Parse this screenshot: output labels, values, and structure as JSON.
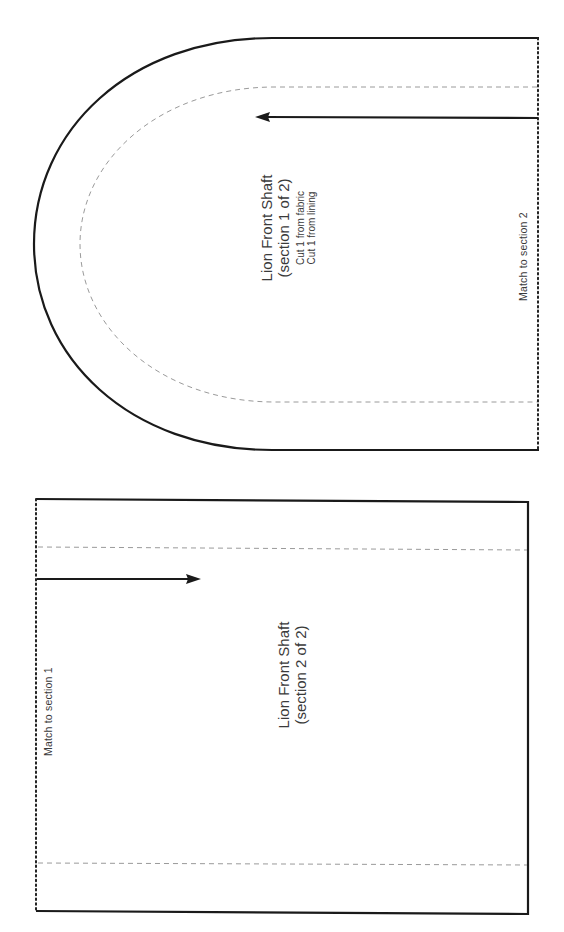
{
  "pieces": {
    "section1": {
      "title": "Lion Front Shaft",
      "subtitle": "(section 1 of 2)",
      "cut_instructions": [
        "Cut 1 from fabric",
        "Cut 1 from lining"
      ],
      "match_label": "Match to section 2"
    },
    "section2": {
      "title": "Lion Front Shaft",
      "subtitle": "(section 2 of 2)",
      "match_label": "Match to section 1"
    }
  },
  "legend": {
    "cut_line": "solid",
    "seam_allowance_line": "dashed",
    "match_edge_line": "dotted",
    "grainline": "arrow"
  },
  "colors": {
    "cut_line": "#1a1a1a",
    "seam_line": "#9a9a9a",
    "dotted_edge": "#222222",
    "text": "#3a3a3a"
  }
}
